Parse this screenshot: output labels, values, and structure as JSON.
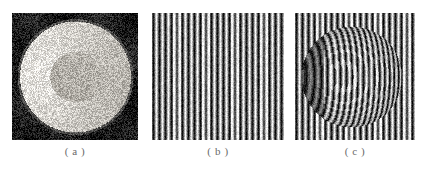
{
  "figure": {
    "background_color": "#ffffff",
    "caption_color": "#6a6a6a",
    "panel_count": 3
  },
  "panels": [
    {
      "id": "a",
      "caption": "( a )",
      "kind": "photograph",
      "subject": "illuminated sphere on dark background",
      "description": "Grainy grayscale photograph of a bright spherical object with a concentric bright annulus and darker central disc, set against a dark square background.",
      "x": 12,
      "y": 13,
      "width": 126,
      "height": 127,
      "colors": {
        "background": "#1c1c1c",
        "highlight": "#f2f0ec",
        "midtone": "#9a968e",
        "shadow": "#262320"
      },
      "sphere": {
        "center_x": 0.5,
        "center_y": 0.5,
        "radius": 0.46
      },
      "annulus": {
        "inner_radius": 0.2,
        "outer_radius": 0.44
      },
      "noise_amount": 0.34
    },
    {
      "id": "b",
      "caption": "( b )",
      "kind": "fringe-pattern",
      "subject": "undeformed reference fringe pattern",
      "description": "Square field of straight vertical black and white fringes of uniform pitch, used as the reference grating.",
      "x": 152,
      "y": 13,
      "width": 132,
      "height": 127,
      "colors": {
        "background": "#ffffff",
        "fringe_dark": "#121212",
        "fringe_light": "#f4f4f4"
      },
      "fringe_count": 23,
      "fringe_period_px": 5.8,
      "fringe_duty_cycle": 0.45,
      "deformed": false,
      "noise_amount": 0.2
    },
    {
      "id": "c",
      "caption": "( c )",
      "kind": "fringe-pattern",
      "subject": "fringe pattern deformed by the sphere",
      "description": "Same vertical fringe grating projected onto the sphere; fringes bow and bend over the spherical surface, producing curved phase-modulated fringes inside a circular region.",
      "x": 295,
      "y": 13,
      "width": 120,
      "height": 127,
      "colors": {
        "background": "#ffffff",
        "fringe_dark": "#121212",
        "fringe_light": "#f4f4f4"
      },
      "fringe_count": 21,
      "fringe_period_px": 5.8,
      "fringe_duty_cycle": 0.45,
      "deformed": true,
      "object_region": {
        "center_x": 0.47,
        "center_y": 0.5,
        "radius": 0.42
      },
      "max_phase_shift_px": 9.0,
      "noise_amount": 0.2
    }
  ]
}
